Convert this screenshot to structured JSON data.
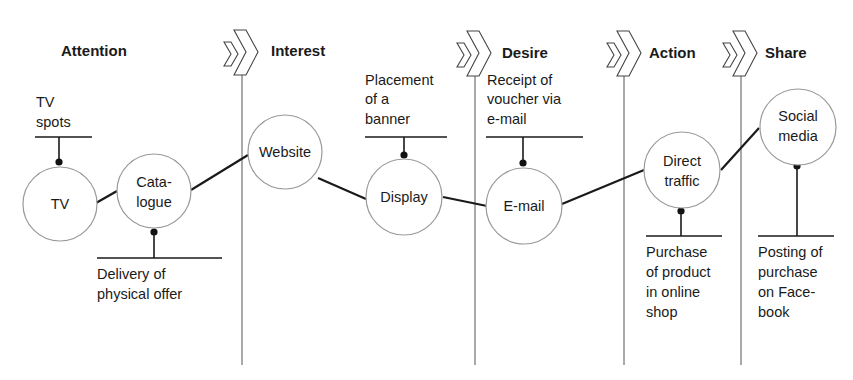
{
  "stages": [
    {
      "id": "attention",
      "label": "Attention"
    },
    {
      "id": "interest",
      "label": "Interest"
    },
    {
      "id": "desire",
      "label": "Desire"
    },
    {
      "id": "action",
      "label": "Action"
    },
    {
      "id": "share",
      "label": "Share"
    }
  ],
  "nodes": [
    {
      "id": "tv",
      "lines": [
        "TV"
      ]
    },
    {
      "id": "catalogue",
      "lines": [
        "Cata-",
        "logue"
      ]
    },
    {
      "id": "website",
      "lines": [
        "Website"
      ]
    },
    {
      "id": "display",
      "lines": [
        "Display"
      ]
    },
    {
      "id": "email",
      "lines": [
        "E-mail"
      ]
    },
    {
      "id": "direct-traffic",
      "lines": [
        "Direct",
        "traffic"
      ]
    },
    {
      "id": "social-media",
      "lines": [
        "Social",
        "media"
      ]
    }
  ],
  "annotations": [
    {
      "node": "tv",
      "position": "above",
      "lines": [
        "TV",
        "spots"
      ]
    },
    {
      "node": "catalogue",
      "position": "below",
      "lines": [
        "Delivery of",
        "physical offer"
      ]
    },
    {
      "node": "display",
      "position": "above",
      "lines": [
        "Placement",
        "of a",
        "banner"
      ]
    },
    {
      "node": "email",
      "position": "above",
      "lines": [
        "Receipt of",
        "voucher via",
        "e-mail"
      ]
    },
    {
      "node": "direct-traffic",
      "position": "below",
      "lines": [
        "Purchase",
        "of product",
        "in online",
        "shop"
      ]
    },
    {
      "node": "social-media",
      "position": "below",
      "lines": [
        "Posting of",
        "purchase",
        "on Face-",
        "book"
      ]
    }
  ],
  "connections": [
    [
      "tv",
      "catalogue"
    ],
    [
      "catalogue",
      "website"
    ],
    [
      "website",
      "display"
    ],
    [
      "display",
      "email"
    ],
    [
      "email",
      "direct-traffic"
    ],
    [
      "direct-traffic",
      "social-media"
    ]
  ],
  "icons": {
    "stage_separator": "double-chevron-icon"
  }
}
